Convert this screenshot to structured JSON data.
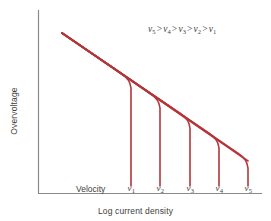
{
  "figure": {
    "background_color": "#ffffff",
    "curve_color": "#b3363a",
    "axis_color": "#8a8a8a",
    "text_color": "#3d3d3d"
  },
  "axes": {
    "xlabel": "Log current density",
    "ylabel": "Overvoltage",
    "velocity_label": "Velocity"
  },
  "legend": {
    "symbol": "v",
    "operator": ">",
    "order": [
      "5",
      "4",
      "3",
      "2",
      "1"
    ],
    "text": "v5 > v4 > v3 > v2 > v1"
  },
  "ticks": [
    {
      "symbol": "v",
      "sub": "1"
    },
    {
      "symbol": "v",
      "sub": "2"
    },
    {
      "symbol": "v",
      "sub": "3"
    },
    {
      "symbol": "v",
      "sub": "4"
    },
    {
      "symbol": "v",
      "sub": "5"
    }
  ],
  "chart_data": {
    "type": "line",
    "title": "",
    "xlabel": "Log current density",
    "ylabel": "Overvoltage",
    "grid": false,
    "legend_position": "top-right",
    "annotations": [
      {
        "text": "v5 > v4 > v3 > v2 > v1",
        "x": 0.62,
        "y": 0.93
      },
      {
        "text": "Velocity",
        "x": 0.21,
        "y": 0.04
      }
    ],
    "axis_ranges": {
      "x": [
        0,
        1
      ],
      "y": [
        0,
        1
      ],
      "note": "axes are qualitative; no numeric tick values shown"
    },
    "x_tick_labels": [
      "v1",
      "v2",
      "v3",
      "v4",
      "v5"
    ],
    "x_tick_positions": [
      0.415,
      0.545,
      0.675,
      0.805,
      0.935
    ],
    "y_tick_labels": [],
    "series": [
      {
        "name": "Tafel line (activation control)",
        "description": "Straight sloping line of overvoltage vs log current density, common to all velocities",
        "points": [
          [
            0.107,
            0.878
          ],
          [
            0.935,
            0.297
          ]
        ]
      },
      {
        "name": "v1",
        "description": "Limiting current plateau at lowest velocity; vertical rise at lowest current density",
        "branch_point": [
          0.415,
          0.697
        ],
        "points": [
          [
            0.107,
            0.878
          ],
          [
            0.392,
            0.712
          ],
          [
            0.413,
            0.672
          ],
          [
            0.415,
            0.045
          ]
        ]
      },
      {
        "name": "v2",
        "description": "Limiting current at second lowest velocity",
        "branch_point": [
          0.545,
          0.606
        ],
        "points": [
          [
            0.107,
            0.878
          ],
          [
            0.522,
            0.621
          ],
          [
            0.543,
            0.581
          ],
          [
            0.545,
            0.045
          ]
        ]
      },
      {
        "name": "v3",
        "description": "Limiting current at intermediate velocity",
        "branch_point": [
          0.675,
          0.515
        ],
        "points": [
          [
            0.107,
            0.878
          ],
          [
            0.652,
            0.53
          ],
          [
            0.673,
            0.49
          ],
          [
            0.675,
            0.045
          ]
        ]
      },
      {
        "name": "v4",
        "description": "Limiting current at second highest velocity",
        "branch_point": [
          0.805,
          0.424
        ],
        "points": [
          [
            0.107,
            0.878
          ],
          [
            0.782,
            0.439
          ],
          [
            0.803,
            0.399
          ],
          [
            0.805,
            0.045
          ]
        ]
      },
      {
        "name": "v5",
        "description": "Limiting current at highest velocity; vertical rise at highest current density",
        "branch_point": [
          0.935,
          0.333
        ],
        "points": [
          [
            0.107,
            0.878
          ],
          [
            0.912,
            0.348
          ],
          [
            0.933,
            0.308
          ],
          [
            0.935,
            0.045
          ]
        ]
      }
    ]
  }
}
